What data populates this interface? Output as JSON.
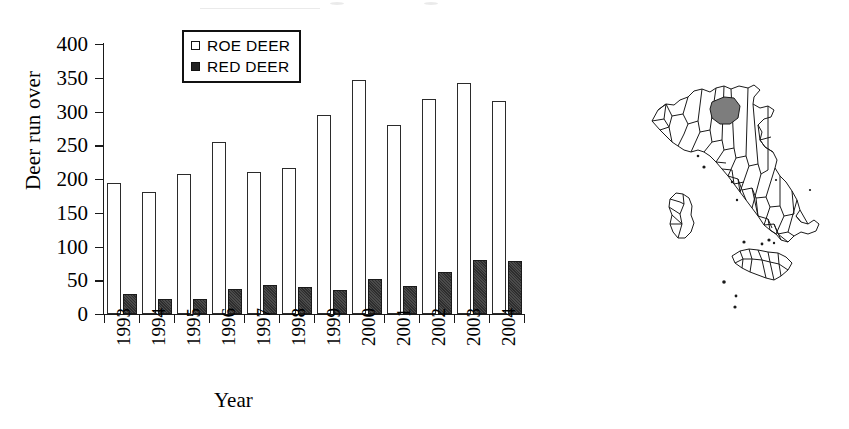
{
  "chart_data": {
    "type": "bar",
    "title": "",
    "xlabel": "Year",
    "ylabel": "Deer run over",
    "categories": [
      "1993",
      "1994",
      "1995",
      "1996",
      "1997",
      "1998",
      "1999",
      "2000",
      "2001",
      "2002",
      "2003",
      "2004"
    ],
    "series": [
      {
        "name": "ROE DEER",
        "color": "#ffffff",
        "values": [
          194,
          181,
          208,
          255,
          211,
          217,
          295,
          346,
          280,
          319,
          342,
          315
        ]
      },
      {
        "name": "RED DEER",
        "color": "#2e2e2e",
        "values": [
          30,
          22,
          22,
          37,
          43,
          40,
          36,
          52,
          42,
          62,
          80,
          79
        ]
      }
    ],
    "ylim": [
      0,
      400
    ],
    "yticks": [
      0,
      50,
      100,
      150,
      200,
      250,
      300,
      350,
      400
    ],
    "grid": false,
    "legend_position": "top-center"
  },
  "legend": {
    "items": [
      {
        "label": "ROE DEER",
        "key": "open-square-icon"
      },
      {
        "label": "RED DEER",
        "key": "filled-square-icon"
      }
    ]
  },
  "map": {
    "name": "italy-map",
    "caption": "",
    "highlighted_region_color": "#7d7d7d",
    "outline_color": "#1a1a1a"
  }
}
